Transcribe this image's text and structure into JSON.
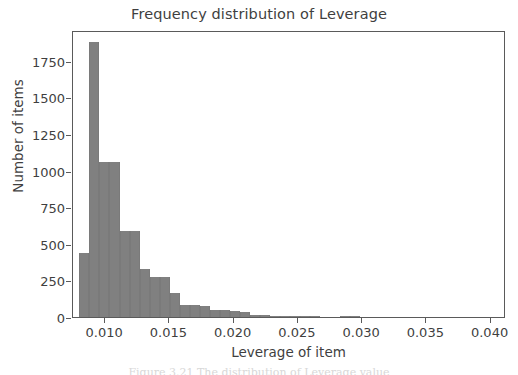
{
  "chart_data": {
    "type": "bar",
    "subtype": "histogram",
    "title": "Frequency distribution of Leverage",
    "xlabel": "Leverage of item",
    "ylabel": "Number of items",
    "xlim": [
      0.0075,
      0.0412
    ],
    "ylim": [
      0,
      1960
    ],
    "grid": false,
    "legend": null,
    "bar_color": "#808080",
    "bin_width": 0.00078,
    "xticks": [
      0.01,
      0.015,
      0.02,
      0.025,
      0.03,
      0.035,
      0.04
    ],
    "xtick_labels": [
      "0.010",
      "0.015",
      "0.020",
      "0.025",
      "0.030",
      "0.035",
      "0.040"
    ],
    "yticks": [
      0,
      250,
      500,
      750,
      1000,
      1250,
      1500,
      1750
    ],
    "ytick_labels": [
      "0",
      "250",
      "500",
      "750",
      "1000",
      "1250",
      "1500",
      "1750"
    ],
    "bins": [
      {
        "x0": 0.008,
        "x1": 0.00878,
        "value": 440
      },
      {
        "x0": 0.00878,
        "x1": 0.00956,
        "value": 1875
      },
      {
        "x0": 0.00956,
        "x1": 0.01034,
        "value": 1060
      },
      {
        "x0": 0.01034,
        "x1": 0.01112,
        "value": 1060
      },
      {
        "x0": 0.01112,
        "x1": 0.0119,
        "value": 585
      },
      {
        "x0": 0.0119,
        "x1": 0.01268,
        "value": 585
      },
      {
        "x0": 0.01268,
        "x1": 0.01346,
        "value": 330
      },
      {
        "x0": 0.01346,
        "x1": 0.01424,
        "value": 270
      },
      {
        "x0": 0.01424,
        "x1": 0.01502,
        "value": 270
      },
      {
        "x0": 0.01502,
        "x1": 0.0158,
        "value": 165
      },
      {
        "x0": 0.0158,
        "x1": 0.01658,
        "value": 80
      },
      {
        "x0": 0.01658,
        "x1": 0.01736,
        "value": 80
      },
      {
        "x0": 0.01736,
        "x1": 0.01814,
        "value": 78
      },
      {
        "x0": 0.01814,
        "x1": 0.01892,
        "value": 45
      },
      {
        "x0": 0.01892,
        "x1": 0.0197,
        "value": 45
      },
      {
        "x0": 0.0197,
        "x1": 0.02048,
        "value": 40
      },
      {
        "x0": 0.02048,
        "x1": 0.02126,
        "value": 35
      },
      {
        "x0": 0.02126,
        "x1": 0.02204,
        "value": 14
      },
      {
        "x0": 0.02204,
        "x1": 0.02282,
        "value": 12
      },
      {
        "x0": 0.02282,
        "x1": 0.0236,
        "value": 10
      },
      {
        "x0": 0.0236,
        "x1": 0.02438,
        "value": 6
      },
      {
        "x0": 0.02438,
        "x1": 0.02516,
        "value": 5
      },
      {
        "x0": 0.02516,
        "x1": 0.02594,
        "value": 2
      },
      {
        "x0": 0.02594,
        "x1": 0.02672,
        "value": 1
      },
      {
        "x0": 0.02828,
        "x1": 0.02906,
        "value": 10
      },
      {
        "x0": 0.02906,
        "x1": 0.02984,
        "value": 3
      }
    ]
  },
  "caption": "Figure 3.21 The distribution of Leverage value"
}
